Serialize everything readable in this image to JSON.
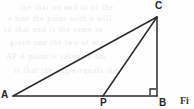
{
  "figure": {
    "kind": "geometry-diagram",
    "shape": "right-triangle-with-cevian",
    "background_color": "#fefefe",
    "stroke_color": "#2b2b2b",
    "stroke_width": 1.5,
    "width": 194,
    "height": 109,
    "labels": {
      "a": "A",
      "b": "B",
      "c": "C",
      "p": "P"
    },
    "points": {
      "A": {
        "x": 13,
        "y": 96
      },
      "B": {
        "x": 157,
        "y": 96
      },
      "C": {
        "x": 157,
        "y": 17
      },
      "P": {
        "x": 103,
        "y": 96
      }
    },
    "segments": [
      {
        "name": "AC",
        "from": "A",
        "to": "C"
      },
      {
        "name": "AB",
        "from": "A",
        "to": "B"
      },
      {
        "name": "CB",
        "from": "C",
        "to": "B"
      },
      {
        "name": "PC",
        "from": "P",
        "to": "C"
      }
    ],
    "right_angle": {
      "at": "B",
      "marker_size": 6
    }
  },
  "caption": {
    "fragment": "Fi"
  },
  "ghost_text": {
    "lines": [
      "the  that  on  and  to  of  the",
      "a  line  the  point  with  a  will",
      "so  that  and  is  the  same  in",
      "given  one  the  two  of  are",
      "AP  A  point  is  taken  so  the",
      "is  that  the  angle  equals  the"
    ]
  }
}
